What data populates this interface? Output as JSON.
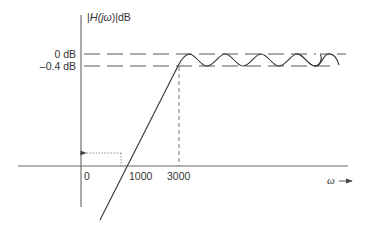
{
  "diagram": {
    "type": "chebyshev-lowpass-magnitude-response",
    "y_axis_label": {
      "prefix": "|",
      "H": "H",
      "j": "(j",
      "omega": "ω",
      "suffix": ")|dB"
    },
    "y_ticks": [
      {
        "label": "0 dB",
        "value_db": 0
      },
      {
        "label": "–0.4 dB",
        "value_db": -0.4
      }
    ],
    "x_ticks": [
      {
        "label": "0",
        "value": 0
      },
      {
        "label": "1000",
        "value": 1000
      },
      {
        "label": "3000",
        "value": 3000
      }
    ],
    "x_axis_label": "ω",
    "x_axis_arrow": "→",
    "passband_edge": 3000,
    "ripple_db": 0.4,
    "colors": {
      "axis": "#555555",
      "curve": "#333333",
      "guide": "#777777",
      "text": "#333333"
    }
  }
}
